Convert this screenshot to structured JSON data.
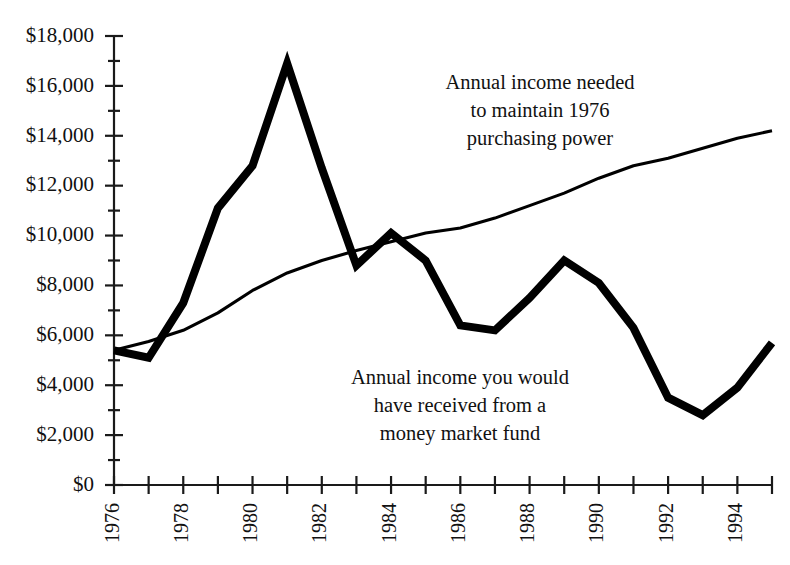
{
  "chart_data": {
    "type": "line",
    "title": "",
    "xlabel": "",
    "ylabel": "",
    "x": [
      1976,
      1977,
      1978,
      1979,
      1980,
      1981,
      1982,
      1983,
      1984,
      1985,
      1986,
      1987,
      1988,
      1989,
      1990,
      1991,
      1992,
      1993,
      1994,
      1995
    ],
    "xlim": [
      1976,
      1995
    ],
    "ylim": [
      0,
      18000
    ],
    "grid": false,
    "legend_position": "inline-annotations",
    "x_tick_labels": [
      "1976",
      "",
      "1978",
      "",
      "1980",
      "",
      "1982",
      "",
      "1984",
      "",
      "1986",
      "",
      "1988",
      "",
      "1990",
      "",
      "1992",
      "",
      "1994",
      ""
    ],
    "y_tick_labels": [
      "$0",
      "$2,000",
      "$4,000",
      "$6,000",
      "$8,000",
      "$10,000",
      "$12,000",
      "$14,000",
      "$16,000",
      "$18,000"
    ],
    "y_tick_values": [
      0,
      2000,
      4000,
      6000,
      8000,
      10000,
      12000,
      14000,
      16000,
      18000
    ],
    "y_minor_tick_step": 1000,
    "series": [
      {
        "name": "Annual income you would have received from a money market fund",
        "style": "thick",
        "values": [
          5400,
          5100,
          7300,
          11100,
          12800,
          16900,
          12700,
          8800,
          10100,
          9000,
          6400,
          6200,
          7500,
          9000,
          8100,
          6300,
          3500,
          2800,
          3900,
          5700
        ]
      },
      {
        "name": "Annual income needed to maintain 1976 purchasing power",
        "style": "thin",
        "values": [
          5400,
          5750,
          6200,
          6900,
          7800,
          8500,
          9000,
          9400,
          9750,
          10100,
          10300,
          10700,
          11200,
          11700,
          12300,
          12800,
          13100,
          13500,
          13900,
          14200
        ]
      }
    ],
    "annotations": [
      {
        "id": "upper-annotation",
        "lines": [
          "Annual income needed",
          "to maintain 1976",
          "purchasing power"
        ],
        "x": 540,
        "y": 89
      },
      {
        "id": "lower-annotation",
        "lines": [
          "Annual income you would",
          "have received from a",
          "money market fund"
        ],
        "x": 460,
        "y": 384
      }
    ]
  }
}
